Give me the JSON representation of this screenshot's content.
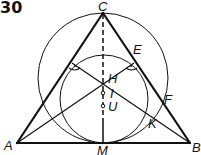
{
  "figure": {
    "number": "30",
    "points": {
      "A": {
        "label": "A",
        "x": 17,
        "y": 143,
        "label_x": 4,
        "label_y": 150
      },
      "B": {
        "label": "B",
        "x": 190,
        "y": 143,
        "label_x": 192,
        "label_y": 152
      },
      "C": {
        "label": "C",
        "x": 103,
        "y": 13,
        "label_x": 98,
        "label_y": 11
      },
      "E": {
        "label": "E",
        "x": 134,
        "y": 63,
        "label_x": 133,
        "label_y": 53
      },
      "F": {
        "label": "F",
        "x": 163,
        "y": 108,
        "label_x": 165,
        "label_y": 105
      },
      "H": {
        "label": "H",
        "x": 103,
        "y": 77,
        "label_x": 108,
        "label_y": 83
      },
      "I": {
        "label": "I",
        "x": 103,
        "y": 93,
        "label_x": 109,
        "label_y": 98
      },
      "U": {
        "label": "U",
        "x": 103,
        "y": 106,
        "label_x": 108,
        "label_y": 111
      },
      "K": {
        "label": "K",
        "x": 150,
        "y": 115,
        "label_x": 149,
        "label_y": 127
      },
      "M": {
        "label": "M",
        "x": 103,
        "y": 143,
        "label_x": 97,
        "label_y": 155
      }
    },
    "circles": [
      {
        "name": "large-circle",
        "cx": 103,
        "cy": 78,
        "r": 65
      },
      {
        "name": "small-circle",
        "cx": 104,
        "cy": 99,
        "r": 44
      }
    ],
    "right_angle_markers": [
      "E",
      "E-mirror"
    ],
    "colors": {
      "ink": "#111111",
      "background": "#ffffff"
    }
  }
}
